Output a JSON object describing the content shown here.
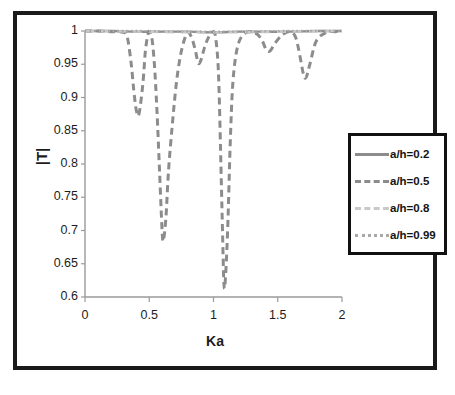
{
  "figure": {
    "background": "#ffffff",
    "frame_color": "#1a1a1a"
  },
  "chart_data": {
    "type": "line",
    "title": "",
    "xlabel": "Ka",
    "ylabel": "|T|",
    "xlim": [
      0,
      2
    ],
    "ylim": [
      0.6,
      1
    ],
    "xticks": [
      "0",
      "0.5",
      "1",
      "1.5",
      "2"
    ],
    "xtick_values": [
      0,
      0.5,
      1,
      1.5,
      2
    ],
    "yticks": [
      "0.6",
      "0.65",
      "0.7",
      "0.75",
      "0.8",
      "0.85",
      "0.9",
      "0.95",
      "1"
    ],
    "ytick_values": [
      0.6,
      0.65,
      0.7,
      0.75,
      0.8,
      0.85,
      0.9,
      0.95,
      1
    ],
    "grid": false,
    "legend_position": "right",
    "legend_entries": [
      "a/h=0.2",
      "a/h=0.5",
      "a/h=0.8",
      "a/h=0.99"
    ],
    "series": [
      {
        "name": "a/h=0.2",
        "style": "solid",
        "color": "#8c8c8c",
        "x": [
          0,
          0.2,
          0.4,
          0.6,
          0.8,
          1.0,
          1.2,
          1.4,
          1.6,
          1.8,
          2.0
        ],
        "values": [
          1.0,
          1.0,
          0.999,
          0.999,
          0.999,
          0.998,
          0.999,
          0.999,
          0.999,
          1.0,
          1.0
        ]
      },
      {
        "name": "a/h=0.5",
        "style": "dashed",
        "color": "#8c8c8c",
        "x": [
          0,
          0.1,
          0.2,
          0.3,
          0.33,
          0.36,
          0.38,
          0.4,
          0.42,
          0.45,
          0.47,
          0.49,
          0.5,
          0.52,
          0.54,
          0.56,
          0.58,
          0.6,
          0.61,
          0.63,
          0.65,
          0.68,
          0.71,
          0.74,
          0.77,
          0.8,
          0.83,
          0.86,
          0.88,
          0.9,
          0.93,
          0.96,
          1.0,
          1.02,
          1.04,
          1.06,
          1.07,
          1.08,
          1.09,
          1.11,
          1.13,
          1.15,
          1.18,
          1.22,
          1.28,
          1.34,
          1.38,
          1.41,
          1.44,
          1.48,
          1.54,
          1.6,
          1.64,
          1.67,
          1.7,
          1.72,
          1.75,
          1.8,
          1.88,
          1.95,
          2.0
        ],
        "values": [
          1.0,
          1.0,
          0.999,
          0.998,
          0.99,
          0.95,
          0.91,
          0.88,
          0.875,
          0.92,
          0.97,
          0.995,
          0.999,
          0.99,
          0.95,
          0.88,
          0.79,
          0.7,
          0.685,
          0.72,
          0.79,
          0.86,
          0.92,
          0.96,
          0.985,
          0.998,
          0.99,
          0.97,
          0.952,
          0.955,
          0.975,
          0.99,
          0.999,
          0.985,
          0.93,
          0.78,
          0.7,
          0.625,
          0.62,
          0.7,
          0.83,
          0.92,
          0.97,
          0.992,
          0.999,
          0.995,
          0.985,
          0.972,
          0.97,
          0.982,
          0.995,
          0.999,
          0.99,
          0.965,
          0.935,
          0.93,
          0.95,
          0.985,
          0.998,
          0.999,
          1.0
        ]
      },
      {
        "name": "a/h=0.8",
        "style": "long-dash",
        "color": "#c9c9c9",
        "x": [
          0,
          0.4,
          0.8,
          1.2,
          1.6,
          2.0
        ],
        "values": [
          1.0,
          0.999,
          0.998,
          0.998,
          0.999,
          1.0
        ]
      },
      {
        "name": "a/h=0.99",
        "style": "dotted",
        "color": "#a8a8a8",
        "x": [
          0,
          0.4,
          0.8,
          1.2,
          1.6,
          2.0
        ],
        "values": [
          1.0,
          1.0,
          0.999,
          0.999,
          1.0,
          1.0
        ]
      }
    ],
    "annotations": [
      {
        "label": "deepest-minimum",
        "x": 1.08,
        "y": 0.62
      },
      {
        "label": "second-minimum",
        "x": 0.61,
        "y": 0.685
      },
      {
        "label": "third-minimum",
        "x": 0.41,
        "y": 0.875
      },
      {
        "label": "fourth-minimum",
        "x": 1.7,
        "y": 0.93
      },
      {
        "label": "fifth-minimum",
        "x": 0.88,
        "y": 0.952
      },
      {
        "label": "sixth-minimum",
        "x": 1.43,
        "y": 0.97
      }
    ]
  }
}
